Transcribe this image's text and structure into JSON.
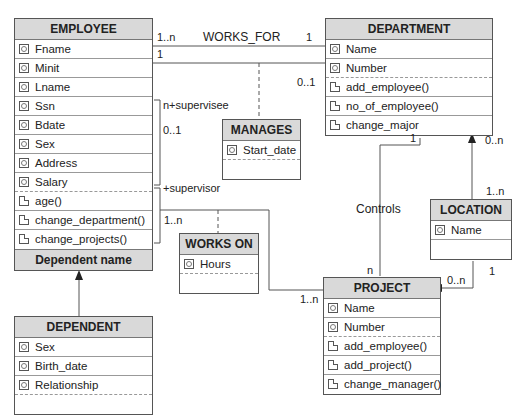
{
  "classes": {
    "employee": {
      "name": "EMPLOYEE",
      "attributes": [
        "Fname",
        "Minit",
        "Lname",
        "Ssn",
        "Bdate",
        "Sex",
        "Address",
        "Salary"
      ],
      "operations": [
        "age()",
        "change_department()",
        "change_projects()"
      ],
      "footer": "Dependent name"
    },
    "department": {
      "name": "DEPARTMENT",
      "attributes": [
        "Name",
        "Number"
      ],
      "operations": [
        "add_employee()",
        "no_of_employee()",
        "change_major"
      ]
    },
    "manages": {
      "name": "MANAGES",
      "attributes": [
        "Start_date"
      ]
    },
    "works_on": {
      "name": "WORKS ON",
      "attributes": [
        "Hours"
      ]
    },
    "location": {
      "name": "LOCATION",
      "attributes": [
        "Name"
      ]
    },
    "project": {
      "name": "PROJECT",
      "attributes": [
        "Name",
        "Number"
      ],
      "operations": [
        "add_employee()",
        "add_project()",
        "change_manager()"
      ]
    },
    "dependent": {
      "name": "DEPENDENT",
      "attributes": [
        "Sex",
        "Birth_date",
        "Relationship"
      ]
    }
  },
  "associations": {
    "works_for": {
      "label": "WORKS_FOR",
      "emp_mult": "1..n",
      "dept_mult": "1"
    },
    "manages": {
      "emp_mult": "1",
      "dept_mult": "0..1"
    },
    "supervision": {
      "supervisee_role": "n+supervisee",
      "supervisee_mult": "0..1",
      "supervisor_role": "+supervisor"
    },
    "works_on": {
      "emp_mult": "1..n",
      "proj_mult": "1..n"
    },
    "controls": {
      "label": "Controls",
      "dept_mult": "1",
      "proj_mult": "n"
    },
    "dept_location": {
      "dept_mult": "0..n",
      "loc_mult": "1..n"
    },
    "proj_location": {
      "loc_mult": "1",
      "proj_mult": "0..n"
    }
  }
}
